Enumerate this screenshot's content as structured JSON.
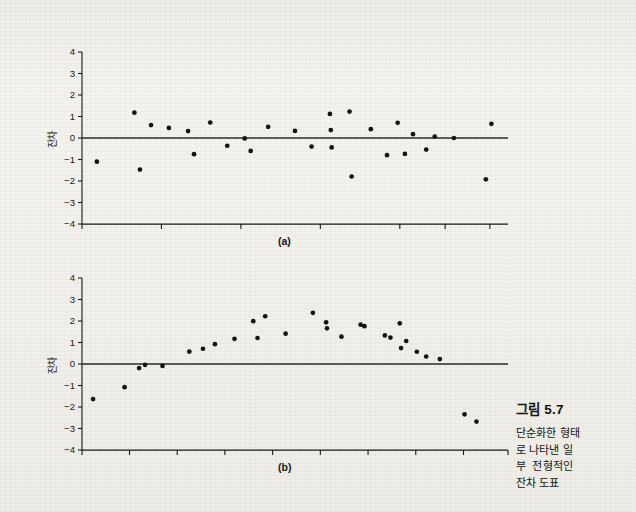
{
  "figure": {
    "caption_title": "그림 5.7",
    "caption_lines": [
      "단순화한 형태",
      "로 나타낸 일",
      "부  전형적인",
      "잔차 도표"
    ],
    "panel_a_label": "(a)",
    "panel_b_label": "(b)",
    "y_axis_label": "잔차",
    "background_color": "#efeeea",
    "ink_color": "#1b1913"
  },
  "chart_data": [
    {
      "type": "scatter",
      "title": "(a)",
      "xlabel": "",
      "ylabel": "잔차",
      "ylim": [
        -4,
        4
      ],
      "xlim": [
        0,
        100
      ],
      "yticks": [
        "4",
        "3",
        "2",
        "1",
        "0",
        "-1",
        "-2",
        "-3",
        "-4"
      ],
      "ytick_values": [
        4,
        3,
        2,
        1,
        0,
        -1,
        -2,
        -3,
        -4
      ],
      "xticks": [],
      "grid": false,
      "legend": "none",
      "zero_line": 0,
      "annotations": [
        "random scatter of residuals about zero"
      ],
      "points": [
        {
          "x": 3.5,
          "y": -1.1
        },
        {
          "x": 12.3,
          "y": 1.18
        },
        {
          "x": 13.6,
          "y": -1.47
        },
        {
          "x": 16.2,
          "y": 0.6
        },
        {
          "x": 20.4,
          "y": 0.47
        },
        {
          "x": 24.9,
          "y": 0.32
        },
        {
          "x": 26.3,
          "y": -0.75
        },
        {
          "x": 30.1,
          "y": 0.72
        },
        {
          "x": 34.1,
          "y": -0.36
        },
        {
          "x": 38.2,
          "y": -0.02
        },
        {
          "x": 39.6,
          "y": -0.6
        },
        {
          "x": 43.7,
          "y": 0.52
        },
        {
          "x": 50.0,
          "y": 0.33
        },
        {
          "x": 53.9,
          "y": -0.4
        },
        {
          "x": 58.2,
          "y": 1.12
        },
        {
          "x": 58.4,
          "y": 0.37
        },
        {
          "x": 58.6,
          "y": -0.44
        },
        {
          "x": 62.8,
          "y": 1.23
        },
        {
          "x": 63.3,
          "y": -1.79
        },
        {
          "x": 67.8,
          "y": 0.41
        },
        {
          "x": 71.6,
          "y": -0.8
        },
        {
          "x": 74.1,
          "y": 0.71
        },
        {
          "x": 75.8,
          "y": -0.74
        },
        {
          "x": 77.7,
          "y": 0.18
        },
        {
          "x": 80.8,
          "y": -0.54
        },
        {
          "x": 82.8,
          "y": 0.07
        },
        {
          "x": 87.3,
          "y": 0.0
        },
        {
          "x": 96.1,
          "y": 0.66
        },
        {
          "x": 94.8,
          "y": -1.92
        }
      ]
    },
    {
      "type": "scatter",
      "title": "(b)",
      "xlabel": "",
      "ylabel": "잔차",
      "ylim": [
        -4,
        4
      ],
      "xlim": [
        0,
        100
      ],
      "yticks": [
        "4",
        "3",
        "2",
        "1",
        "0",
        "-1",
        "-2",
        "-3",
        "-4"
      ],
      "ytick_values": [
        4,
        3,
        2,
        1,
        0,
        -1,
        -2,
        -3,
        -4
      ],
      "xticks": [],
      "grid": false,
      "legend": "none",
      "zero_line": 0,
      "annotations": [
        "curved (non-linear) pattern in residuals with two low outliers"
      ],
      "points": [
        {
          "x": 2.6,
          "y": -1.63
        },
        {
          "x": 10.0,
          "y": -1.08
        },
        {
          "x": 13.4,
          "y": -0.19
        },
        {
          "x": 14.8,
          "y": -0.04
        },
        {
          "x": 18.9,
          "y": -0.09
        },
        {
          "x": 25.2,
          "y": 0.58
        },
        {
          "x": 28.4,
          "y": 0.71
        },
        {
          "x": 31.2,
          "y": 0.92
        },
        {
          "x": 35.8,
          "y": 1.17
        },
        {
          "x": 40.2,
          "y": 1.99
        },
        {
          "x": 41.2,
          "y": 1.21
        },
        {
          "x": 43.0,
          "y": 2.22
        },
        {
          "x": 47.8,
          "y": 1.41
        },
        {
          "x": 54.2,
          "y": 2.38
        },
        {
          "x": 57.3,
          "y": 1.94
        },
        {
          "x": 57.5,
          "y": 1.66
        },
        {
          "x": 60.9,
          "y": 1.27
        },
        {
          "x": 65.4,
          "y": 1.83
        },
        {
          "x": 66.3,
          "y": 1.76
        },
        {
          "x": 71.1,
          "y": 1.33
        },
        {
          "x": 72.4,
          "y": 1.23
        },
        {
          "x": 74.6,
          "y": 1.89
        },
        {
          "x": 74.9,
          "y": 0.74
        },
        {
          "x": 76.1,
          "y": 1.07
        },
        {
          "x": 78.6,
          "y": 0.57
        },
        {
          "x": 80.8,
          "y": 0.35
        },
        {
          "x": 84.0,
          "y": 0.23
        },
        {
          "x": 89.8,
          "y": -2.34
        },
        {
          "x": 92.6,
          "y": -2.68
        }
      ]
    }
  ]
}
